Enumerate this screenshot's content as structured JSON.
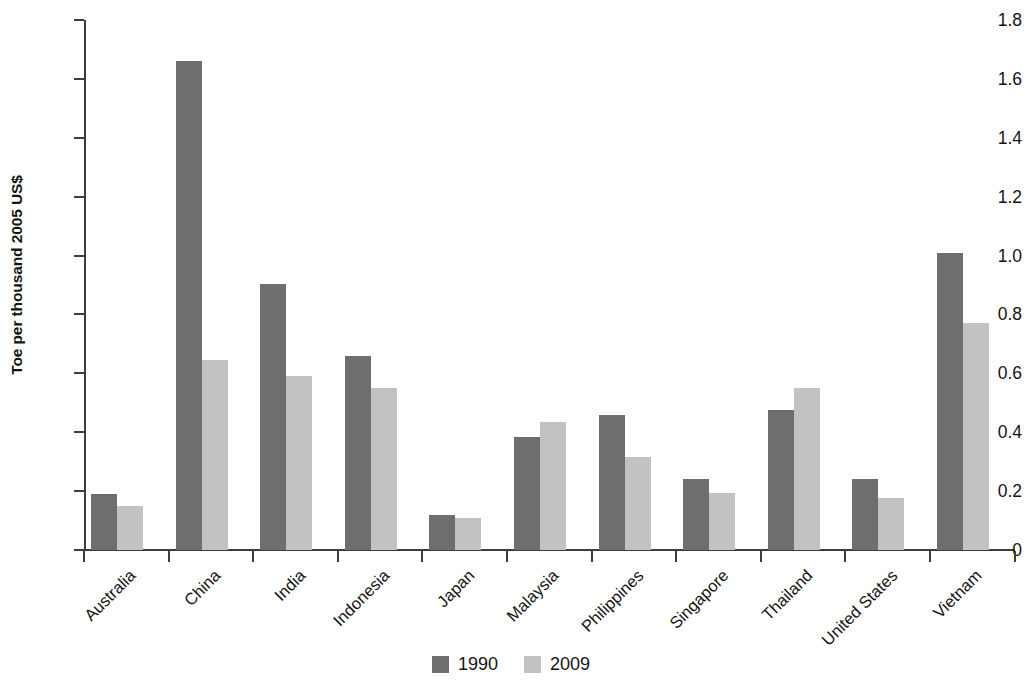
{
  "chart_data": {
    "type": "bar",
    "title": "",
    "subtitle": "",
    "xlabel": "",
    "ylabel": "Toe per thousand 2005 US$",
    "ylim": [
      0,
      1.8
    ],
    "ytick_labels": [
      "0",
      "0.2",
      "0.4",
      "0.6",
      "0.8",
      "1.0",
      "1.2",
      "1.4",
      "1.6",
      "1.8"
    ],
    "ytick_values": [
      0,
      0.2,
      0.4,
      0.6,
      0.8,
      1.0,
      1.2,
      1.4,
      1.6,
      1.8
    ],
    "grid": false,
    "legend_position": "bottom-center",
    "categories": [
      "Australia",
      "China",
      "India",
      "Indonesia",
      "Japan",
      "Malaysia",
      "Philippines",
      "Singapore",
      "Thailand",
      "United States",
      "Vietnam"
    ],
    "series": [
      {
        "name": "1990",
        "color": "#6e6e6e",
        "values": [
          0.19,
          1.66,
          0.905,
          0.66,
          0.12,
          0.385,
          0.46,
          0.24,
          0.475,
          0.24,
          1.01
        ]
      },
      {
        "name": "2009",
        "color": "#c2c2c2",
        "values": [
          0.148,
          0.645,
          0.59,
          0.55,
          0.11,
          0.435,
          0.315,
          0.193,
          0.55,
          0.175,
          0.77
        ]
      }
    ]
  },
  "legend": {
    "items": [
      {
        "label": "1990",
        "color": "#6e6e6e"
      },
      {
        "label": "2009",
        "color": "#c2c2c2"
      }
    ]
  },
  "axis": {
    "y_title": "Toe per thousand 2005 US$"
  }
}
